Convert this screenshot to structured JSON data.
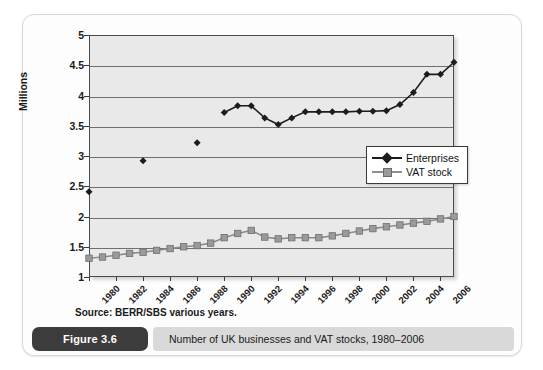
{
  "figure": {
    "badge_label": "Figure 3.6",
    "caption": "Number of UK businesses and VAT stocks, 1980–2006",
    "source_note": "Source: BERR/SBS various years."
  },
  "legend": {
    "position": "inside-right",
    "entries": [
      {
        "label": "Enterprises",
        "marker": "diamond",
        "color": "#1c1c1c"
      },
      {
        "label": "VAT stock",
        "marker": "square",
        "color": "#9a9a9a"
      }
    ]
  },
  "chart_data": {
    "type": "line",
    "title": "",
    "xlabel": "",
    "ylabel": "Millions",
    "ylim": [
      1,
      5
    ],
    "ytick_step": 0.5,
    "ytick_labels": [
      "5",
      "4.5",
      "4",
      "3.5",
      "3",
      "2.5",
      "2",
      "1.5",
      "1"
    ],
    "ytick_values": [
      5,
      4.5,
      4,
      3.5,
      3,
      2.5,
      2,
      1.5,
      1
    ],
    "grid": true,
    "xlim": [
      1980,
      2007
    ],
    "x": [
      1980,
      1981,
      1982,
      1983,
      1984,
      1985,
      1986,
      1987,
      1988,
      1989,
      1990,
      1991,
      1992,
      1993,
      1994,
      1995,
      1996,
      1997,
      1998,
      1999,
      2000,
      2001,
      2002,
      2003,
      2004,
      2005,
      2006,
      2007
    ],
    "xtick_labels": [
      "1980",
      "1982",
      "1984",
      "1986",
      "1988",
      "1990",
      "1992",
      "1994",
      "1996",
      "1998",
      "2000",
      "2002",
      "2004",
      "2006"
    ],
    "xtick_values": [
      1980,
      1982,
      1984,
      1986,
      1988,
      1990,
      1992,
      1994,
      1996,
      1998,
      2000,
      2002,
      2004,
      2006
    ],
    "series": [
      {
        "name": "Enterprises",
        "marker": "diamond",
        "color": "#1c1c1c",
        "values": [
          2.41,
          null,
          null,
          null,
          2.92,
          null,
          null,
          null,
          3.22,
          null,
          3.72,
          3.83,
          3.83,
          3.63,
          3.52,
          3.63,
          3.73,
          3.73,
          3.73,
          3.73,
          3.74,
          3.74,
          3.75,
          3.85,
          4.05,
          4.35,
          4.35,
          4.55
        ]
      },
      {
        "name": "VAT stock",
        "marker": "square",
        "color": "#9a9a9a",
        "values": [
          1.31,
          1.33,
          1.36,
          1.39,
          1.41,
          1.44,
          1.47,
          1.5,
          1.52,
          1.56,
          1.65,
          1.72,
          1.77,
          1.66,
          1.63,
          1.65,
          1.65,
          1.65,
          1.68,
          1.72,
          1.76,
          1.8,
          1.83,
          1.86,
          1.89,
          1.92,
          1.96,
          2.0
        ]
      }
    ]
  }
}
